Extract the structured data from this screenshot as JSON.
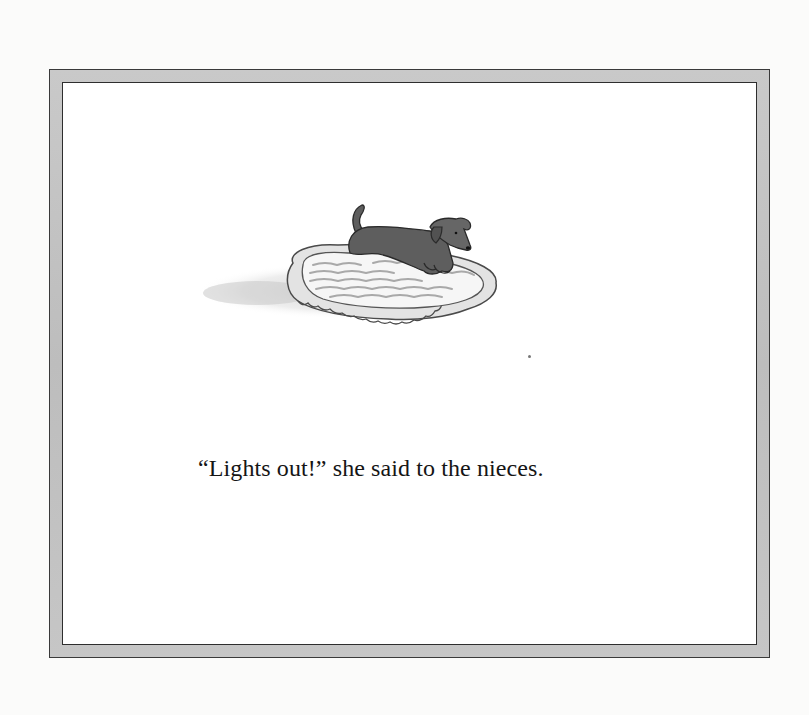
{
  "page": {
    "caption": "“Lights out!” she said to the nieces.",
    "illustration": {
      "subject": "small dark dog lying on a ruffled quilted pillow",
      "icon": "dog-on-pillow-illustration"
    },
    "colors": {
      "background": "#fbfbfa",
      "frame": "#c4c4c4",
      "frame_line": "#333333",
      "inner_panel": "#ffffff",
      "dog": "#5e5e5e",
      "pillow": "#f2f2f2",
      "text": "#151515"
    }
  }
}
